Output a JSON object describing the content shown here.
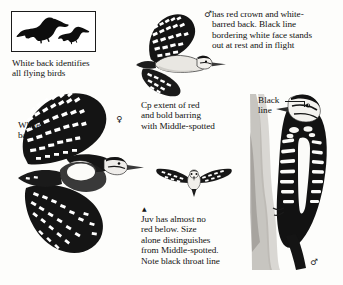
{
  "page": {
    "kind": "field-guide-plate",
    "background_color": "#fdfdfb",
    "ink_color": "#111111"
  },
  "inset": {
    "name": "flying-silhouette-inset",
    "caption": "White back identifies\nall flying birds",
    "silhouettes": [
      {
        "name": "large-bird-silhouette",
        "fill": "#0d0d0d"
      },
      {
        "name": "small-bird-silhouette",
        "fill": "#0d0d0d"
      }
    ]
  },
  "labels": {
    "white_back": "White\nback",
    "black_line": "Black\nline"
  },
  "notes": {
    "male_note": "has red crown and white-\nbarred back. Black line\nbordering white face stands\nout at rest and in flight",
    "compare_note": "Cp extent of red\nand bold barring\nwith Middle-spotted",
    "juvenile_note": "Juv has almost no\nred below. Size\nalone distinguishes\nfrom Middle-spotted.\nNote black throat line"
  },
  "symbols": {
    "male": "♂",
    "female": "♀",
    "male_perched": "♂",
    "juvenile_marker": "▲"
  },
  "figures": [
    {
      "name": "flying-woodpecker-upper",
      "pose": "in-flight-side",
      "sex": "male",
      "description": "Woodpecker in flight seen from the side with barred upper wing"
    },
    {
      "name": "flying-woodpecker-large",
      "pose": "in-flight-from-above",
      "sex": "female",
      "description": "Large woodpecker in flight from above showing white back"
    },
    {
      "name": "flying-woodpecker-head-on",
      "pose": "in-flight-head-on",
      "sex": "juvenile",
      "description": "Small woodpecker flying head-on with wings outstretched"
    },
    {
      "name": "perched-woodpecker",
      "pose": "clinging-to-trunk",
      "sex": "male",
      "description": "Woodpecker clinging to a tree trunk, rear view"
    }
  ]
}
